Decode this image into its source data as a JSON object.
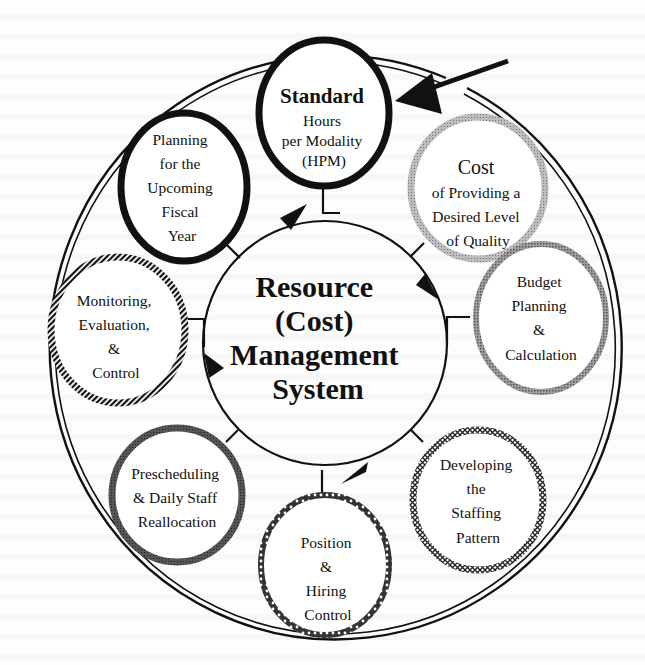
{
  "diagram": {
    "title": "Resource (Cost) Management System",
    "center": {
      "lines": [
        "Resource",
        "(Cost)",
        "Management",
        "System"
      ]
    },
    "nodes": [
      {
        "id": "standard-hours",
        "lines": [
          "Standard",
          "Hours",
          "per Modality",
          "(HPM)"
        ],
        "style": "solid-black"
      },
      {
        "id": "cost-quality",
        "lines": [
          "Cost",
          "of Providing a",
          "Desired Level",
          "of Quality"
        ],
        "style": "light-gray"
      },
      {
        "id": "budget",
        "lines": [
          "Budget",
          "Planning",
          "&",
          "Calculation"
        ],
        "style": "mid-gray"
      },
      {
        "id": "staffing-pattern",
        "lines": [
          "Developing",
          "the",
          "Staffing",
          "Pattern"
        ],
        "style": "crosshatch"
      },
      {
        "id": "position-hiring",
        "lines": [
          "Position",
          "&",
          "Hiring",
          "Control"
        ],
        "style": "chain"
      },
      {
        "id": "prescheduling",
        "lines": [
          "Prescheduling",
          "& Daily Staff",
          "Reallocation"
        ],
        "style": "dark-gray"
      },
      {
        "id": "monitoring",
        "lines": [
          "Monitoring,",
          "Evaluation,",
          "&",
          "Control"
        ],
        "style": "diagonal-stripe"
      },
      {
        "id": "planning",
        "lines": [
          "Planning",
          "for the",
          "Upcoming",
          "Fiscal",
          "Year"
        ],
        "style": "solid-black"
      }
    ],
    "pointer_arrow": {
      "target": "standard-hours"
    },
    "colors": {
      "ink": "#111111",
      "light_gray": "#a8a8a8",
      "mid_gray": "#8f8f8f",
      "dark_gray": "#555555",
      "paper": "#fdfdfd"
    }
  }
}
